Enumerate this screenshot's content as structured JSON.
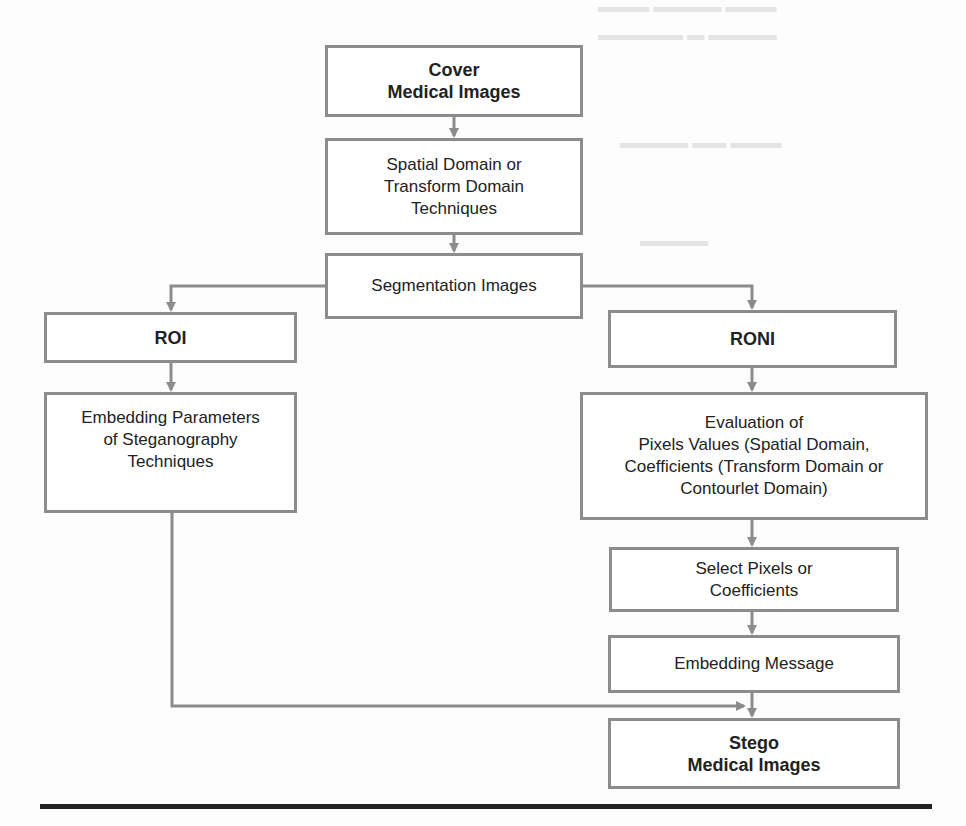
{
  "diagram": {
    "type": "flowchart",
    "nodes": [
      {
        "id": "cover",
        "label": "Cover\nMedical Images",
        "bold": true
      },
      {
        "id": "techniques",
        "label": "Spatial Domain or\nTransform Domain\nTechniques",
        "bold": false
      },
      {
        "id": "segmentation",
        "label": "Segmentation Images",
        "bold": false
      },
      {
        "id": "roi",
        "label": "ROI",
        "bold": true
      },
      {
        "id": "roni",
        "label": "RONI",
        "bold": true
      },
      {
        "id": "embedding_params",
        "label": "Embedding Parameters\nof Steganography\nTechniques",
        "bold": false
      },
      {
        "id": "evaluation",
        "label": "Evaluation of\nPixels Values (Spatial Domain,\nCoefficients (Transform Domain or\nContourlet Domain)",
        "bold": false
      },
      {
        "id": "select",
        "label": "Select Pixels or\nCoefficients",
        "bold": false
      },
      {
        "id": "embedding_message",
        "label": "Embedding Message",
        "bold": false
      },
      {
        "id": "stego",
        "label": "Stego\nMedical Images",
        "bold": true
      }
    ],
    "edges": [
      {
        "from": "cover",
        "to": "techniques"
      },
      {
        "from": "techniques",
        "to": "segmentation"
      },
      {
        "from": "segmentation",
        "to": "roi"
      },
      {
        "from": "segmentation",
        "to": "roni"
      },
      {
        "from": "roi",
        "to": "embedding_params"
      },
      {
        "from": "roni",
        "to": "evaluation"
      },
      {
        "from": "evaluation",
        "to": "select"
      },
      {
        "from": "select",
        "to": "embedding_message"
      },
      {
        "from": "embedding_message",
        "to": "stego"
      },
      {
        "from": "embedding_params",
        "to": "stego"
      }
    ],
    "colors": {
      "border": "#8c8c8c",
      "text": "#222222",
      "rule": "#222222"
    }
  }
}
